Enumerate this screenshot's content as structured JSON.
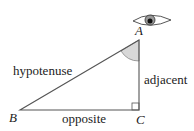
{
  "diagram": {
    "vertices": {
      "A": "A",
      "B": "B",
      "C": "C"
    },
    "sides": {
      "hypotenuse": "hypotenuse",
      "adjacent": "adjacent",
      "opposite": "opposite"
    },
    "icons": {
      "eye": "eye-icon",
      "angle_marker": "angle-arc",
      "right_angle": "right-angle-square"
    },
    "colors": {
      "stroke": "#555555",
      "angle_fill": "#d8d8d8",
      "text": "#222222"
    }
  }
}
